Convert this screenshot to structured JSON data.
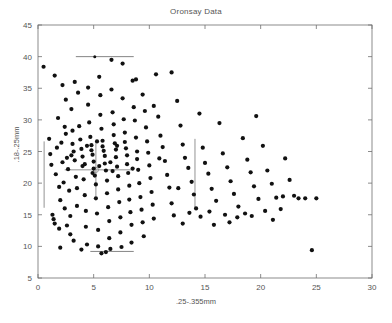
{
  "chart_data": {
    "type": "scatter",
    "title": "Oronsay Data",
    "xlabel": ".25-.355mm",
    "ylabel": ".18-.25mm",
    "xlim": [
      0,
      30
    ],
    "ylim": [
      5,
      45
    ],
    "xticks": [
      0,
      5,
      10,
      15,
      20,
      25,
      30
    ],
    "yticks": [
      5,
      10,
      15,
      20,
      25,
      30,
      35,
      40,
      45
    ],
    "grid": false,
    "legend": "none",
    "marker": {
      "shape": "dot",
      "color": "#111111",
      "size": 2.1
    },
    "annotations": [
      {
        "name": "upper-horizontal-bar",
        "type": "hline",
        "y": 40.0,
        "x0": 3.4,
        "x1": 8.6,
        "color": "#777777",
        "center_marker": true,
        "center_x": 5.1
      },
      {
        "name": "lower-horizontal-bar",
        "type": "hline",
        "y": 9.2,
        "x0": 4.7,
        "x1": 8.6,
        "color": "#777777",
        "center_marker": false
      },
      {
        "name": "left-vertical-bar",
        "type": "vline",
        "x": 0.55,
        "y0": 16.1,
        "y1": 26.6,
        "color": "#888888"
      },
      {
        "name": "middle-vertical-bar",
        "type": "vline",
        "x": 14.1,
        "y0": 16.1,
        "y1": 27.0,
        "color": "#888888"
      },
      {
        "name": "centroid-crosshair",
        "type": "cross",
        "x": 5.2,
        "y": 22.1,
        "x0": 2.4,
        "x1": 8.6,
        "y0": 17.9,
        "y1": 26.3,
        "color": "#888888"
      }
    ],
    "points": [
      [
        0.5,
        38.4
      ],
      [
        1.0,
        27.0
      ],
      [
        1.1,
        24.6
      ],
      [
        1.2,
        22.9
      ],
      [
        1.3,
        15.0
      ],
      [
        1.4,
        14.3
      ],
      [
        1.5,
        13.6
      ],
      [
        1.6,
        21.4
      ],
      [
        1.7,
        25.6
      ],
      [
        1.8,
        30.3
      ],
      [
        1.9,
        19.4
      ],
      [
        2.0,
        17.3
      ],
      [
        2.0,
        9.8
      ],
      [
        2.1,
        26.4
      ],
      [
        2.2,
        23.3
      ],
      [
        2.3,
        20.1
      ],
      [
        2.4,
        16.0
      ],
      [
        2.5,
        33.2
      ],
      [
        2.5,
        27.8
      ],
      [
        2.6,
        24.0
      ],
      [
        2.7,
        22.2
      ],
      [
        2.8,
        18.8
      ],
      [
        2.9,
        14.8
      ],
      [
        2.9,
        11.9
      ],
      [
        3.0,
        31.7
      ],
      [
        3.1,
        28.3
      ],
      [
        3.1,
        26.2
      ],
      [
        3.2,
        25.0
      ],
      [
        3.3,
        23.6
      ],
      [
        3.4,
        21.0
      ],
      [
        3.5,
        19.2
      ],
      [
        3.5,
        16.4
      ],
      [
        3.6,
        34.3
      ],
      [
        3.7,
        29.0
      ],
      [
        3.8,
        26.9
      ],
      [
        3.9,
        25.4
      ],
      [
        4.0,
        24.2
      ],
      [
        4.0,
        22.7
      ],
      [
        4.1,
        20.6
      ],
      [
        4.2,
        18.1
      ],
      [
        4.3,
        15.6
      ],
      [
        4.3,
        13.1
      ],
      [
        4.4,
        10.3
      ],
      [
        4.5,
        35.1
      ],
      [
        4.5,
        32.4
      ],
      [
        4.6,
        29.6
      ],
      [
        4.7,
        27.3
      ],
      [
        4.8,
        26.0
      ],
      [
        4.8,
        25.2
      ],
      [
        4.9,
        24.5
      ],
      [
        5.0,
        23.4
      ],
      [
        5.0,
        22.3
      ],
      [
        5.1,
        21.2
      ],
      [
        5.2,
        19.8
      ],
      [
        5.2,
        17.6
      ],
      [
        5.3,
        15.2
      ],
      [
        5.4,
        12.6
      ],
      [
        5.4,
        10.0
      ],
      [
        5.5,
        36.8
      ],
      [
        5.6,
        33.9
      ],
      [
        5.6,
        30.8
      ],
      [
        5.7,
        28.6
      ],
      [
        5.8,
        26.7
      ],
      [
        5.8,
        25.8
      ],
      [
        5.9,
        25.1
      ],
      [
        6.0,
        24.3
      ],
      [
        6.0,
        23.1
      ],
      [
        6.1,
        22.0
      ],
      [
        6.2,
        20.4
      ],
      [
        6.2,
        18.4
      ],
      [
        6.3,
        16.2
      ],
      [
        6.4,
        14.0
      ],
      [
        6.4,
        11.3
      ],
      [
        6.5,
        9.6
      ],
      [
        6.6,
        39.5
      ],
      [
        6.6,
        34.8
      ],
      [
        6.7,
        31.2
      ],
      [
        6.8,
        29.3
      ],
      [
        6.8,
        27.6
      ],
      [
        6.9,
        26.3
      ],
      [
        7.0,
        25.3
      ],
      [
        7.0,
        24.1
      ],
      [
        7.1,
        22.6
      ],
      [
        7.2,
        21.1
      ],
      [
        7.2,
        19.0
      ],
      [
        7.3,
        17.0
      ],
      [
        7.4,
        14.6
      ],
      [
        7.4,
        12.2
      ],
      [
        7.5,
        9.9
      ],
      [
        7.6,
        38.9
      ],
      [
        7.6,
        33.4
      ],
      [
        7.7,
        30.1
      ],
      [
        7.8,
        28.0
      ],
      [
        7.8,
        26.5
      ],
      [
        7.9,
        25.5
      ],
      [
        8.0,
        24.4
      ],
      [
        8.0,
        23.0
      ],
      [
        8.1,
        21.6
      ],
      [
        8.2,
        19.6
      ],
      [
        8.2,
        17.4
      ],
      [
        8.3,
        15.4
      ],
      [
        8.4,
        13.4
      ],
      [
        8.4,
        10.6
      ],
      [
        8.5,
        36.2
      ],
      [
        8.6,
        32.0
      ],
      [
        8.7,
        29.9
      ],
      [
        8.8,
        27.2
      ],
      [
        8.9,
        25.0
      ],
      [
        8.9,
        23.8
      ],
      [
        9.0,
        22.1
      ],
      [
        9.1,
        20.0
      ],
      [
        9.2,
        17.8
      ],
      [
        9.3,
        15.8
      ],
      [
        9.4,
        13.8
      ],
      [
        9.5,
        11.6
      ],
      [
        9.6,
        31.4
      ],
      [
        9.7,
        28.8
      ],
      [
        9.8,
        26.6
      ],
      [
        9.9,
        24.8
      ],
      [
        10.0,
        22.8
      ],
      [
        10.1,
        20.8
      ],
      [
        10.2,
        18.6
      ],
      [
        10.3,
        16.6
      ],
      [
        10.4,
        14.4
      ],
      [
        10.6,
        37.2
      ],
      [
        10.8,
        30.5
      ],
      [
        11.0,
        27.5
      ],
      [
        11.2,
        25.7
      ],
      [
        11.4,
        23.5
      ],
      [
        11.6,
        21.3
      ],
      [
        11.8,
        19.3
      ],
      [
        12.0,
        16.8
      ],
      [
        12.2,
        14.9
      ],
      [
        12.5,
        33.0
      ],
      [
        12.8,
        29.1
      ],
      [
        13.0,
        26.1
      ],
      [
        13.2,
        24.0
      ],
      [
        13.5,
        22.4
      ],
      [
        13.8,
        20.2
      ],
      [
        14.0,
        18.2
      ],
      [
        14.2,
        16.0
      ],
      [
        14.5,
        31.0
      ],
      [
        14.8,
        25.6
      ],
      [
        15.0,
        23.2
      ],
      [
        15.3,
        21.5
      ],
      [
        15.6,
        19.1
      ],
      [
        16.0,
        17.2
      ],
      [
        16.3,
        29.5
      ],
      [
        16.6,
        24.7
      ],
      [
        17.0,
        22.5
      ],
      [
        17.3,
        20.3
      ],
      [
        17.6,
        18.3
      ],
      [
        18.0,
        16.3
      ],
      [
        18.4,
        27.1
      ],
      [
        18.8,
        23.7
      ],
      [
        19.1,
        21.7
      ],
      [
        19.4,
        19.5
      ],
      [
        19.8,
        17.5
      ],
      [
        20.2,
        25.9
      ],
      [
        20.6,
        22.0
      ],
      [
        21.0,
        19.9
      ],
      [
        21.4,
        17.7
      ],
      [
        21.8,
        15.9
      ],
      [
        22.2,
        23.9
      ],
      [
        22.6,
        20.5
      ],
      [
        23.0,
        18.0
      ],
      [
        23.4,
        17.6
      ],
      [
        24.0,
        17.6
      ],
      [
        24.6,
        9.4
      ],
      [
        25.0,
        17.6
      ],
      [
        1.5,
        37.0
      ],
      [
        2.2,
        35.5
      ],
      [
        3.3,
        36.0
      ],
      [
        12.0,
        37.5
      ],
      [
        19.6,
        30.6
      ],
      [
        1.9,
        12.8
      ],
      [
        2.6,
        13.3
      ],
      [
        3.2,
        10.9
      ],
      [
        3.9,
        9.5
      ],
      [
        5.7,
        8.9
      ],
      [
        6.1,
        9.1
      ],
      [
        2.4,
        28.9
      ],
      [
        3.0,
        24.4
      ],
      [
        4.4,
        25.9
      ],
      [
        5.3,
        26.6
      ],
      [
        6.5,
        23.3
      ],
      [
        7.1,
        25.9
      ],
      [
        4.2,
        23.0
      ],
      [
        4.9,
        21.6
      ],
      [
        5.5,
        22.7
      ],
      [
        6.7,
        21.9
      ],
      [
        8.5,
        22.3
      ],
      [
        10.9,
        23.9
      ],
      [
        12.6,
        19.2
      ],
      [
        13.6,
        15.3
      ],
      [
        14.6,
        14.7
      ],
      [
        15.4,
        15.5
      ],
      [
        16.8,
        15.0
      ],
      [
        17.9,
        14.6
      ],
      [
        18.6,
        15.2
      ],
      [
        19.2,
        14.8
      ],
      [
        20.4,
        15.6
      ],
      [
        21.1,
        14.2
      ],
      [
        22.0,
        17.9
      ],
      [
        13.0,
        13.6
      ],
      [
        15.8,
        13.4
      ],
      [
        17.2,
        13.8
      ],
      [
        8.8,
        36.4
      ],
      [
        9.4,
        34.0
      ],
      [
        10.4,
        32.2
      ]
    ]
  }
}
